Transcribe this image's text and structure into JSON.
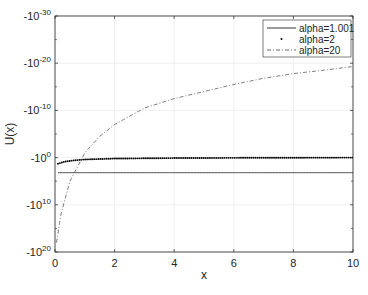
{
  "chart_data": {
    "type": "line",
    "title": "",
    "xlabel": "x",
    "ylabel": "U(x)",
    "xlim": [
      0,
      10
    ],
    "yscale": "log (negative values)",
    "ylim_exponents": [
      -30,
      20
    ],
    "x_ticks": [
      "0",
      "2",
      "4",
      "6",
      "8",
      "10"
    ],
    "y_ticks": [
      {
        "base": "-10",
        "exp": "-30"
      },
      {
        "base": "-10",
        "exp": "-20"
      },
      {
        "base": "-10",
        "exp": "-10"
      },
      {
        "base": "-10",
        "exp": "0"
      },
      {
        "base": "-10",
        "exp": "10"
      },
      {
        "base": "-10",
        "exp": "20"
      }
    ],
    "grid": true,
    "legend_position": "upper right",
    "series": [
      {
        "name": "alpha=1.001",
        "style": "solid",
        "x": [
          0.1,
          2,
          4,
          6,
          8,
          10
        ],
        "y_log10_magnitude": [
          3.2,
          3.2,
          3.2,
          3.2,
          3.2,
          3.2
        ]
      },
      {
        "name": "alpha=2",
        "style": "dotted markers",
        "x": [
          0.1,
          0.3,
          0.6,
          1,
          2,
          4,
          6,
          8,
          10
        ],
        "y_log10_magnitude": [
          1.3,
          0.9,
          0.6,
          0.4,
          0.2,
          0.1,
          0.05,
          0.02,
          0.0
        ]
      },
      {
        "name": "alpha=20",
        "style": "dash-dot",
        "x": [
          0.05,
          0.2,
          0.5,
          1,
          1.5,
          2,
          3,
          4,
          5,
          6,
          7,
          8,
          9,
          10
        ],
        "y_log10_magnitude": [
          18,
          12,
          5,
          -1,
          -4.5,
          -7,
          -10.5,
          -12.5,
          -14,
          -15.5,
          -16.8,
          -17.8,
          -18.5,
          -19.3
        ]
      }
    ]
  },
  "legend": {
    "items": [
      {
        "label": "alpha=1.001"
      },
      {
        "label": "alpha=2"
      },
      {
        "label": "alpha=20"
      }
    ]
  }
}
